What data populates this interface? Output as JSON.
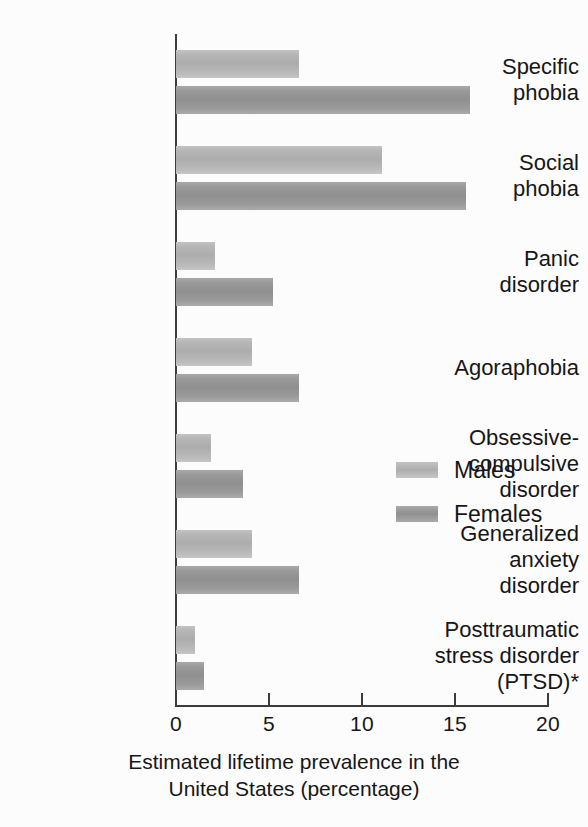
{
  "chart_data": {
    "type": "bar",
    "orientation": "horizontal",
    "title": "",
    "xlabel": "Estimated lifetime prevalence in the\nUnited States (percentage)",
    "ylabel": "",
    "xlim": [
      0,
      20
    ],
    "xticks": [
      0,
      5,
      10,
      15,
      20
    ],
    "xtick_labels": [
      "0",
      "5",
      "10",
      "15",
      "20"
    ],
    "grid": false,
    "legend_position": "center-right",
    "categories": [
      "Specific\nphobia",
      "Social\nphobia",
      "Panic\ndisorder",
      "Agoraphobia",
      "Obsessive-\ncompulsive\ndisorder",
      "Generalized\nanxiety\ndisorder",
      "Posttraumatic\nstress disorder\n(PTSD)*"
    ],
    "series": [
      {
        "name": "Males",
        "color": "#b0b0b0",
        "values": [
          6.6,
          11.1,
          2.1,
          4.1,
          1.9,
          4.1,
          1.0
        ]
      },
      {
        "name": "Females",
        "color": "#949494",
        "values": [
          15.8,
          15.6,
          5.2,
          6.6,
          3.6,
          6.6,
          1.5
        ]
      }
    ]
  },
  "legend": {
    "items": [
      {
        "label": "Males"
      },
      {
        "label": "Females"
      }
    ]
  },
  "axis": {
    "x_title": "Estimated lifetime prevalence in the\nUnited States (percentage)"
  },
  "colors": {
    "males": "#b0b0b0",
    "females": "#949494",
    "axis": "#3b3b3b",
    "text": "#161616",
    "background": "#fcfcfc"
  }
}
